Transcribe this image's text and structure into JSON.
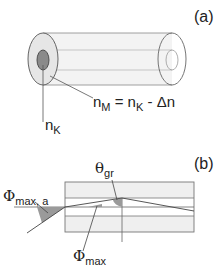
{
  "figure": {
    "panel_a": {
      "label": "(a)",
      "cladding_label": {
        "n": "n",
        "sub": "M",
        "eq": " = n",
        "sub2": "K",
        "rest": " - Δn"
      },
      "core_label": {
        "n": "n",
        "sub": "K"
      }
    },
    "panel_b": {
      "label": "(b)",
      "theta_label": {
        "sym": "θ",
        "sub": "gr"
      },
      "phi_a_label": {
        "sym": "Φ",
        "sub": "max, a"
      },
      "phi_label": {
        "sym": "Φ",
        "sub": "max"
      }
    },
    "colors": {
      "line": "#555555",
      "light_line": "#999999",
      "cladding_fill": "#eeeeee",
      "core_fill": "#888888",
      "angle_fill": "#9a9a9a"
    }
  }
}
